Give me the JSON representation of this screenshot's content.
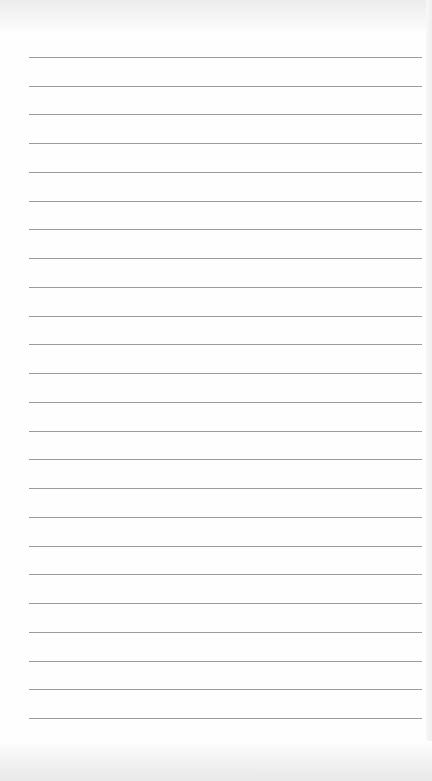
{
  "page": {
    "type": "lined-paper",
    "background_color": "#fefefe",
    "line_color": "#9b9b9b",
    "line_count": 24,
    "first_line_y": 57,
    "line_spacing": 28.74,
    "line_left": 29,
    "line_right": 422
  }
}
